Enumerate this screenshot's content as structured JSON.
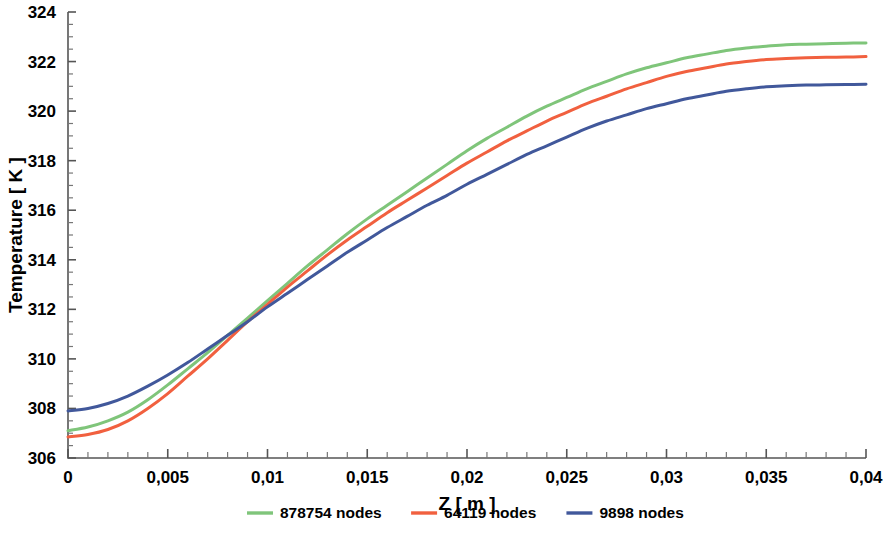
{
  "chart_data": {
    "type": "line",
    "title": "",
    "subtitle": "",
    "xlabel": "Z [ m ]",
    "ylabel": "Temperature [ K ]",
    "xlim": [
      0,
      0.04
    ],
    "ylim": [
      306,
      324
    ],
    "grid": false,
    "legend_position": "bottom",
    "x_tick_labels": [
      "0",
      "0,005",
      "0,01",
      "0,015",
      "0,02",
      "0,025",
      "0,03",
      "0,035",
      "0,04"
    ],
    "x_tick_values": [
      0,
      0.005,
      0.01,
      0.015,
      0.02,
      0.025,
      0.03,
      0.035,
      0.04
    ],
    "x_minor_step": 0.001,
    "y_tick_labels": [
      "306",
      "308",
      "310",
      "312",
      "314",
      "316",
      "318",
      "320",
      "322",
      "324"
    ],
    "y_tick_values": [
      306,
      308,
      310,
      312,
      314,
      316,
      318,
      320,
      322,
      324
    ],
    "y_minor_step": 0.5,
    "decimal_separator": ",",
    "x": [
      0,
      0.001,
      0.002,
      0.003,
      0.004,
      0.005,
      0.006,
      0.007,
      0.008,
      0.009,
      0.01,
      0.011,
      0.012,
      0.013,
      0.014,
      0.015,
      0.016,
      0.017,
      0.018,
      0.019,
      0.02,
      0.021,
      0.022,
      0.023,
      0.024,
      0.025,
      0.026,
      0.027,
      0.028,
      0.029,
      0.03,
      0.031,
      0.032,
      0.033,
      0.034,
      0.035,
      0.036,
      0.037,
      0.038,
      0.039,
      0.04
    ],
    "series": [
      {
        "name": "878754 nodes",
        "color": "#7FC57A",
        "values": [
          307.1,
          307.25,
          307.5,
          307.85,
          308.35,
          308.95,
          309.6,
          310.25,
          310.95,
          311.65,
          312.35,
          313.05,
          313.75,
          314.4,
          315.05,
          315.65,
          316.2,
          316.75,
          317.3,
          317.85,
          318.4,
          318.9,
          319.35,
          319.8,
          320.2,
          320.55,
          320.9,
          321.2,
          321.5,
          321.75,
          321.95,
          322.15,
          322.3,
          322.45,
          322.55,
          322.62,
          322.68,
          322.7,
          322.72,
          322.74,
          322.75
        ]
      },
      {
        "name": "64119 nodes",
        "color": "#F1603F",
        "values": [
          306.85,
          306.95,
          307.15,
          307.5,
          308.0,
          308.6,
          309.3,
          310.0,
          310.75,
          311.5,
          312.2,
          312.9,
          313.55,
          314.2,
          314.8,
          315.35,
          315.9,
          316.4,
          316.9,
          317.4,
          317.9,
          318.35,
          318.8,
          319.2,
          319.6,
          319.95,
          320.3,
          320.6,
          320.9,
          321.15,
          321.4,
          321.6,
          321.75,
          321.9,
          322.0,
          322.08,
          322.12,
          322.15,
          322.17,
          322.18,
          322.2
        ]
      },
      {
        "name": "9898 nodes",
        "color": "#41589B",
        "values": [
          307.9,
          308.0,
          308.2,
          308.5,
          308.9,
          309.35,
          309.85,
          310.4,
          310.95,
          311.5,
          312.1,
          312.65,
          313.2,
          313.75,
          314.3,
          314.8,
          315.3,
          315.75,
          316.2,
          316.6,
          317.05,
          317.45,
          317.85,
          318.25,
          318.6,
          318.95,
          319.3,
          319.6,
          319.85,
          320.1,
          320.3,
          320.5,
          320.65,
          320.8,
          320.9,
          320.98,
          321.02,
          321.05,
          321.06,
          321.07,
          321.08
        ]
      }
    ]
  },
  "legend": {
    "entries": [
      {
        "label": "878754 nodes",
        "color": "#7FC57A"
      },
      {
        "label": "64119 nodes",
        "color": "#F1603F"
      },
      {
        "label": "9898 nodes",
        "color": "#41589B"
      }
    ]
  }
}
